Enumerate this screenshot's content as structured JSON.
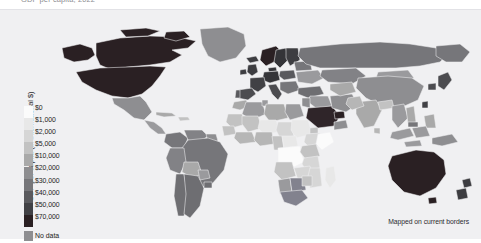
{
  "header": {
    "title_fragment": "GDP per capita, 2022"
  },
  "legend": {
    "axis_label": "GDP per capita (in international $)",
    "no_data_label": "No data",
    "ticks": [
      "$0",
      "$1,000",
      "$2,000",
      "$5,000",
      "$10,000",
      "$20,000",
      "$30,000",
      "$40,000",
      "$50,000",
      "$70,000"
    ],
    "swatch_colors": [
      "#fbfbfb",
      "#e8e8e8",
      "#d6d6d6",
      "#c2c2c2",
      "#a9a9a9",
      "#8e8e91",
      "#76767a",
      "#5a5a5e",
      "#414145",
      "#2a2023"
    ],
    "no_data_color": "#8e8e91"
  },
  "footnote": {
    "text": "Mapped on current borders"
  },
  "colors": {
    "background": "#f3f3f5",
    "ocean": "#f0f0f2",
    "border_stroke": "#f3f3f5",
    "page_background": "#ffffff"
  },
  "chart_data": {
    "type": "heatmap",
    "title": "GDP per capita, 2022",
    "subtitle": "",
    "xlabel": "",
    "ylabel": "",
    "legend_title": "GDP per capita (in international $)",
    "legend_position": "left",
    "grid": false,
    "projection": "world-choropleth",
    "scale_type": "binned-sequential-grey",
    "bins": [
      0,
      1000,
      2000,
      5000,
      10000,
      20000,
      30000,
      40000,
      50000,
      70000
    ],
    "bin_labels": [
      "$0",
      "$1,000",
      "$2,000",
      "$5,000",
      "$10,000",
      "$20,000",
      "$30,000",
      "$40,000",
      "$50,000",
      "$70,000"
    ],
    "bin_colors": [
      "#fbfbfb",
      "#e8e8e8",
      "#d6d6d6",
      "#c2c2c2",
      "#a9a9a9",
      "#8e8e91",
      "#76767a",
      "#5a5a5e",
      "#414145",
      "#2a2023"
    ],
    "no_data_color": "#8e8e91",
    "no_data_label": "No data",
    "annotations": [
      "Mapped on current borders"
    ],
    "regions": [
      {
        "name": "United States",
        "bin": "$50,000",
        "color": "#2a2023"
      },
      {
        "name": "Canada",
        "bin": "$50,000",
        "color": "#2a2023"
      },
      {
        "name": "Mexico",
        "bin": "$20,000",
        "color": "#8e8e91"
      },
      {
        "name": "Greenland",
        "bin": "$40,000",
        "color": "#8e8e91"
      },
      {
        "name": "Brazil",
        "bin": "$10,000",
        "color": "#76767a"
      },
      {
        "name": "Argentina",
        "bin": "$20,000",
        "color": "#6e6e72"
      },
      {
        "name": "Chile",
        "bin": "$20,000",
        "color": "#6e6e72"
      },
      {
        "name": "Colombia",
        "bin": "$10,000",
        "color": "#76767a"
      },
      {
        "name": "Peru",
        "bin": "$10,000",
        "color": "#828286"
      },
      {
        "name": "Bolivia",
        "bin": "$5,000",
        "color": "#a9a9a9"
      },
      {
        "name": "Venezuela",
        "bin": "$10,000",
        "color": "#828286"
      },
      {
        "name": "United Kingdom",
        "bin": "$40,000",
        "color": "#3d3d41"
      },
      {
        "name": "Norway",
        "bin": "$70,000",
        "color": "#2a2023"
      },
      {
        "name": "Sweden",
        "bin": "$50,000",
        "color": "#343438"
      },
      {
        "name": "Finland",
        "bin": "$50,000",
        "color": "#3d3d41"
      },
      {
        "name": "Germany",
        "bin": "$50,000",
        "color": "#343438"
      },
      {
        "name": "France",
        "bin": "$40,000",
        "color": "#414145"
      },
      {
        "name": "Spain",
        "bin": "$40,000",
        "color": "#4c4c50"
      },
      {
        "name": "Italy",
        "bin": "$40,000",
        "color": "#4c4c50"
      },
      {
        "name": "Poland",
        "bin": "$30,000",
        "color": "#5a5a5e"
      },
      {
        "name": "Russia",
        "bin": "$30,000",
        "color": "#76767a"
      },
      {
        "name": "Ukraine",
        "bin": "$10,000",
        "color": "#9a9a9d"
      },
      {
        "name": "Turkey",
        "bin": "$30,000",
        "color": "#6e6e72"
      },
      {
        "name": "Saudi Arabia",
        "bin": "$40,000",
        "color": "#2f2529"
      },
      {
        "name": "United Arab Emirates",
        "bin": "$70,000",
        "color": "#2a2023"
      },
      {
        "name": "Qatar",
        "bin": "$70,000",
        "color": "#2a2023"
      },
      {
        "name": "Iran",
        "bin": "$10,000",
        "color": "#8e8e91"
      },
      {
        "name": "China",
        "bin": "$20,000",
        "color": "#8e8e91"
      },
      {
        "name": "India",
        "bin": "$5,000",
        "color": "#a9a9a9"
      },
      {
        "name": "Japan",
        "bin": "$40,000",
        "color": "#4c4c50"
      },
      {
        "name": "South Korea",
        "bin": "$40,000",
        "color": "#4c4c50"
      },
      {
        "name": "Indonesia",
        "bin": "$10,000",
        "color": "#9a9a9d"
      },
      {
        "name": "Kazakhstan",
        "bin": "$20,000",
        "color": "#828286"
      },
      {
        "name": "Mongolia",
        "bin": "$10,000",
        "color": "#9a9a9d"
      },
      {
        "name": "Pakistan",
        "bin": "$5,000",
        "color": "#b6b6b6"
      },
      {
        "name": "Australia",
        "bin": "$50,000",
        "color": "#2a2023"
      },
      {
        "name": "New Zealand",
        "bin": "$40,000",
        "color": "#3d3d41"
      },
      {
        "name": "South Africa",
        "bin": "$10,000",
        "color": "#828286"
      },
      {
        "name": "Nigeria",
        "bin": "$5,000",
        "color": "#b6b6b6"
      },
      {
        "name": "Egypt",
        "bin": "$10,000",
        "color": "#9a9a9d"
      },
      {
        "name": "Algeria",
        "bin": "$10,000",
        "color": "#9a9a9d"
      },
      {
        "name": "Libya",
        "bin": "$10,000",
        "color": "#a9a9a9"
      },
      {
        "name": "Ethiopia",
        "bin": "$2,000",
        "color": "#d6d6d6"
      },
      {
        "name": "DR Congo",
        "bin": "$1,000",
        "color": "#fbfbfb"
      },
      {
        "name": "Sudan",
        "bin": "$2,000",
        "color": "#e8e8e8"
      },
      {
        "name": "Somalia",
        "bin": "$0",
        "color": "#fbfbfb"
      },
      {
        "name": "Madagascar",
        "bin": "$1,000",
        "color": "#e8e8e8"
      },
      {
        "name": "Niger",
        "bin": "$1,000",
        "color": "#e8e8e8"
      },
      {
        "name": "Chad",
        "bin": "$1,000",
        "color": "#d6d6d6"
      },
      {
        "name": "Botswana",
        "bin": "$10,000",
        "color": "#82828e"
      },
      {
        "name": "Angola",
        "bin": "$5,000",
        "color": "#c2c2c2"
      },
      {
        "name": "Kenya",
        "bin": "$5,000",
        "color": "#c2c2c2"
      },
      {
        "name": "Tanzania",
        "bin": "$2,000",
        "color": "#d6d6d6"
      }
    ]
  }
}
